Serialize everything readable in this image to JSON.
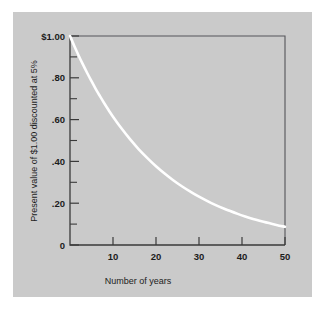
{
  "figure": {
    "background_color": "#ffffff",
    "panel_color": "#cacaca",
    "curve_color": "#ffffff",
    "axis_color": "#3a3a3a"
  },
  "chart_data": {
    "type": "line",
    "title": "",
    "xlabel": "Number of years",
    "ylabel": "Present value of $1.00 discounted at 5%",
    "xlim": [
      0,
      50
    ],
    "ylim": [
      0,
      1.0
    ],
    "grid": false,
    "legend": null,
    "x_tick_labels": [
      "10",
      "20",
      "30",
      "40",
      "50"
    ],
    "x_tick_values": [
      10,
      20,
      30,
      40,
      50
    ],
    "y_tick_labels": [
      "$1.00",
      ".80",
      ".60",
      ".40",
      ".20",
      "0"
    ],
    "y_tick_values": [
      1.0,
      0.8,
      0.6,
      0.4,
      0.2,
      0.0
    ],
    "y_minor_tick_values": [
      0.9,
      0.7,
      0.5,
      0.3,
      0.1
    ],
    "series": [
      {
        "name": "Present value of $1.00 at 5% discount rate",
        "x": [
          0,
          1,
          2,
          3,
          4,
          5,
          6,
          7,
          8,
          9,
          10,
          12,
          14,
          16,
          18,
          20,
          22,
          24,
          26,
          28,
          30,
          33,
          36,
          39,
          42,
          45,
          48,
          50
        ],
        "values": [
          1.0,
          0.952,
          0.907,
          0.864,
          0.823,
          0.784,
          0.746,
          0.711,
          0.677,
          0.645,
          0.614,
          0.557,
          0.505,
          0.458,
          0.416,
          0.377,
          0.342,
          0.31,
          0.281,
          0.255,
          0.231,
          0.199,
          0.172,
          0.149,
          0.128,
          0.111,
          0.096,
          0.087
        ]
      }
    ]
  },
  "labels": {
    "x_axis_title": "Number of years",
    "y_axis_title": "Present value of $1.00 discounted at 5%"
  }
}
